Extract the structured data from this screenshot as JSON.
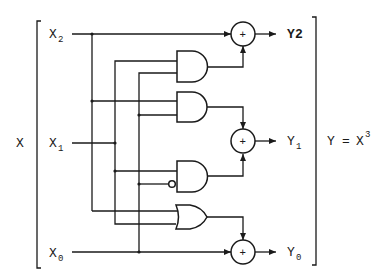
{
  "diagram": {
    "outer_input_label": "X",
    "inputs": [
      {
        "name": "X",
        "sub": "2"
      },
      {
        "name": "X",
        "sub": "1"
      },
      {
        "name": "X",
        "sub": "0"
      }
    ],
    "outputs": [
      {
        "name": "Y",
        "sub": "2",
        "inline": true
      },
      {
        "name": "Y",
        "sub": "1"
      },
      {
        "name": "Y",
        "sub": "0"
      }
    ],
    "equation": {
      "lhs": "Y",
      "eq": "=",
      "rhs": "X",
      "exp": "3"
    },
    "xor_symbol": "+",
    "gates": [
      {
        "id": "and1",
        "type": "AND",
        "inputs": [
          "X1",
          "X0"
        ],
        "feeds": "Y2"
      },
      {
        "id": "and2",
        "type": "AND",
        "inputs": [
          "X2",
          "X0"
        ],
        "feeds": "Y1"
      },
      {
        "id": "and3",
        "type": "AND",
        "inputs": [
          "X1",
          "NOT X0"
        ],
        "feeds": "Y1"
      },
      {
        "id": "or1",
        "type": "OR",
        "inputs": [
          "X2",
          "X1"
        ],
        "feeds": "Y0"
      },
      {
        "id": "xor2",
        "type": "XOR",
        "inputs": [
          "X2",
          "and1"
        ],
        "output": "Y2"
      },
      {
        "id": "xor1",
        "type": "XOR",
        "inputs": [
          "and2",
          "and3"
        ],
        "output": "Y1"
      },
      {
        "id": "xor0",
        "type": "XOR",
        "inputs": [
          "X0",
          "or1"
        ],
        "output": "Y0"
      }
    ],
    "colors": {
      "ink": "#1a1a1a",
      "background": "#ffffff"
    }
  }
}
